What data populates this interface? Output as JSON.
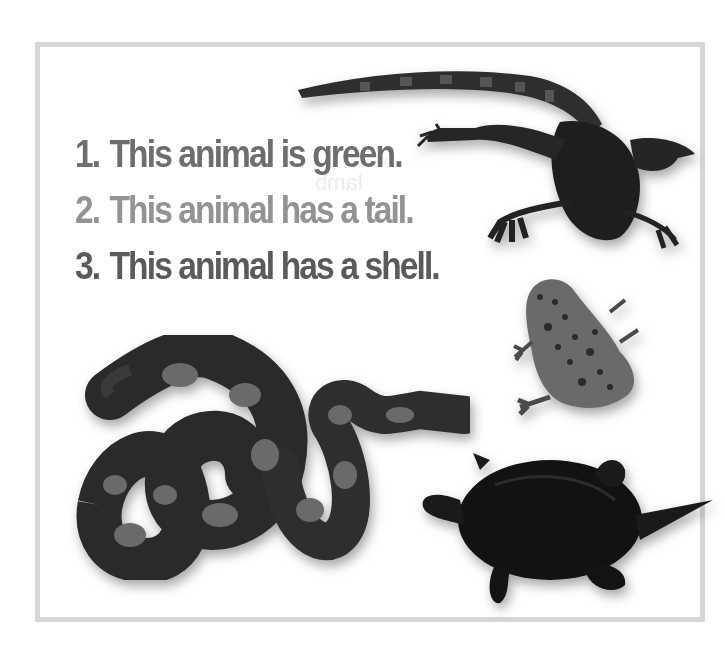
{
  "worksheet": {
    "clues": [
      {
        "number": "1.",
        "text": "This animal is green.",
        "color": "#6e6e6e"
      },
      {
        "number": "2.",
        "text": "This animal has a tail.",
        "color": "#939393"
      },
      {
        "number": "3.",
        "text": "This animal has a shell.",
        "color": "#5a5a5a"
      }
    ],
    "ghost_text": "lamb",
    "animals": [
      {
        "name": "iguana"
      },
      {
        "name": "frog"
      },
      {
        "name": "snake"
      },
      {
        "name": "turtle"
      }
    ],
    "frame_color": "#d6d6d6"
  }
}
